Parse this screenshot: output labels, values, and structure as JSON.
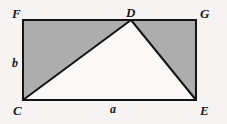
{
  "figure": {
    "type": "geometry-diagram",
    "background_color": "#f6f4f2",
    "line_color": "#141414",
    "shaded_fill": "#adadad",
    "unshaded_fill": "#faf9f8",
    "stroke_width": 2,
    "vertices": [
      {
        "id": "F",
        "label": "F",
        "x": 23,
        "y": 20,
        "label_x": 12,
        "label_y": 7
      },
      {
        "id": "D",
        "label": "D",
        "x": 131,
        "y": 20,
        "label_x": 126,
        "label_y": 6
      },
      {
        "id": "G",
        "label": "G",
        "x": 196,
        "y": 20,
        "label_x": 200,
        "label_y": 7
      },
      {
        "id": "E",
        "label": "E",
        "x": 196,
        "y": 100,
        "label_x": 200,
        "label_y": 104
      },
      {
        "id": "C",
        "label": "C",
        "x": 23,
        "y": 100,
        "label_x": 13,
        "label_y": 104
      }
    ],
    "side_labels": [
      {
        "id": "b",
        "label": "b",
        "side": "CF",
        "x": 12,
        "y": 57
      },
      {
        "id": "a",
        "label": "a",
        "side": "CE",
        "x": 110,
        "y": 103
      }
    ],
    "shaded_polygons": [
      {
        "id": "triangle-FDC",
        "points": "23,20 131,20 23,100"
      },
      {
        "id": "triangle-DGE",
        "points": "131,20 196,20 196,100"
      }
    ],
    "unshaded_polygons": [
      {
        "id": "triangle-CDE",
        "points": "23,100 131,20 196,100"
      }
    ],
    "outline_rect": {
      "x": 23,
      "y": 20,
      "width": 173,
      "height": 80
    },
    "segments": [
      {
        "id": "segment-CD",
        "x1": 23,
        "y1": 100,
        "x2": 131,
        "y2": 20
      },
      {
        "id": "segment-DE",
        "x1": 131,
        "y1": 20,
        "x2": 196,
        "y2": 100
      }
    ]
  }
}
